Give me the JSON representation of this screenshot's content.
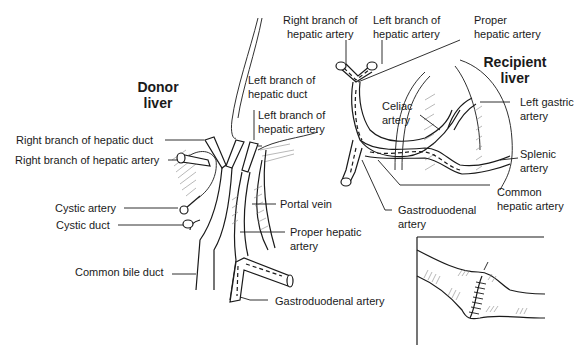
{
  "donor": {
    "title_line1": "Donor",
    "title_line2": "liver",
    "labels": {
      "right_branch_hepatic_duct": "Right branch of hepatic duct",
      "right_branch_hepatic_artery": "Right branch of hepatic artery",
      "left_branch_hepatic_duct_1": "Left branch of",
      "left_branch_hepatic_duct_2": "hepatic duct",
      "left_branch_hepatic_artery_1": "Left branch of",
      "left_branch_hepatic_artery_2": "hepatic artery",
      "cystic_artery": "Cystic artery",
      "cystic_duct": "Cystic duct",
      "portal_vein": "Portal vein",
      "proper_hepatic_artery_1": "Proper hepatic",
      "proper_hepatic_artery_2": "artery",
      "common_bile_duct": "Common bile duct",
      "gastroduodenal_artery": "Gastroduodenal artery"
    }
  },
  "recipient": {
    "title_line1": "Recipient",
    "title_line2": "liver",
    "labels": {
      "right_branch_hepatic_artery_1": "Right branch of",
      "right_branch_hepatic_artery_2": "hepatic artery",
      "left_branch_hepatic_artery_1": "Left branch of",
      "left_branch_hepatic_artery_2": "hepatic artery",
      "proper_hepatic_artery_1": "Proper",
      "proper_hepatic_artery_2": "hepatic artery",
      "celiac_artery_1": "Celiac",
      "celiac_artery_2": "artery",
      "left_gastric_artery_1": "Left gastric",
      "left_gastric_artery_2": "artery",
      "splenic_artery_1": "Splenic",
      "splenic_artery_2": "artery",
      "common_hepatic_artery_1": "Common",
      "common_hepatic_artery_2": "hepatic artery",
      "gastroduodenal_artery_1": "Gastroduodenal",
      "gastroduodenal_artery_2": "artery"
    }
  },
  "inset": {
    "description": "anastomosis-detail"
  }
}
